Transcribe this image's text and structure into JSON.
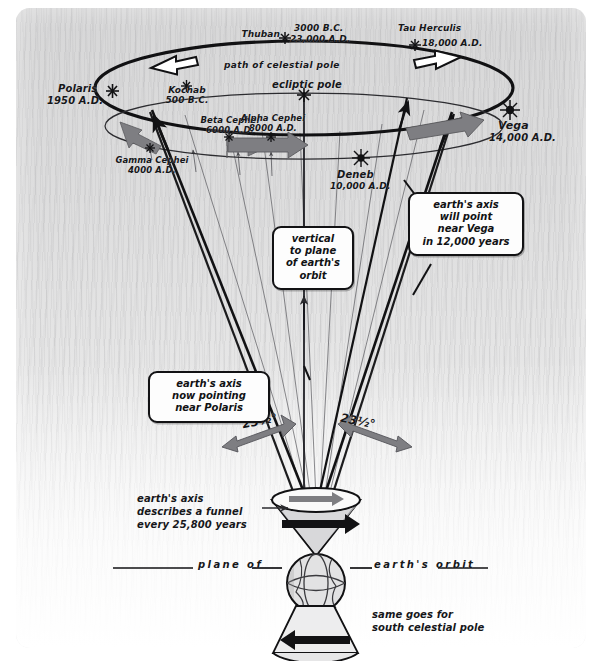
{
  "diagram": {
    "title_region": "precession of the earth's axis",
    "path_label": "path of celestial pole",
    "ecliptic_pole_label": "ecliptic pole",
    "plane_left": "plane of",
    "plane_right": "earth's orbit"
  },
  "stars": [
    {
      "id": "thuban",
      "name": "Thuban",
      "date": "3000 B.C.\n23,000 A.D."
    },
    {
      "id": "tau-herculis",
      "name": "Tau Herculis",
      "date": "18,000 A.D."
    },
    {
      "id": "kochab",
      "name": "Kochab",
      "date": "500 B.C."
    },
    {
      "id": "polaris",
      "name": "Polaris",
      "date": "1950 A.D."
    },
    {
      "id": "vega",
      "name": "Vega",
      "date": "14,000 A.D."
    },
    {
      "id": "gamma-cephei",
      "name": "Gamma Cephei",
      "date": "4000 A.D."
    },
    {
      "id": "beta-cephei",
      "name": "Beta Cephei",
      "date": "6000 A.D."
    },
    {
      "id": "alpha-cephei",
      "name": "Alpha Cephei",
      "date": "8000 A.D."
    },
    {
      "id": "deneb",
      "name": "Deneb",
      "date": "10,000 A.D."
    }
  ],
  "labels": {
    "thuban_name": "Thuban",
    "thuban_date1": "3000 B.C.",
    "thuban_date2": "23,000 A.D.",
    "tau_herculis_name": "Tau Herculis",
    "tau_herculis_date": "18,000 A.D.",
    "kochab_name": "Kochab",
    "kochab_date": "500 B.C.",
    "polaris_name": "Polaris",
    "polaris_date": "1950 A.D.",
    "vega_name": "Vega",
    "vega_date": "14,000 A.D.",
    "gamma_cephei_name": "Gamma Cephei",
    "gamma_cephei_date": "4000 A.D.",
    "beta_cephei_name": "Beta Cephei",
    "beta_cephei_date": "6000 A.D.",
    "alpha_cephei_name": "Alpha Cephei",
    "alpha_cephei_date": "8000 A.D.",
    "deneb_name": "Deneb",
    "deneb_date": "10,000 A.D."
  },
  "callouts": {
    "vega_note": "earth's axis\nwill point\nnear Vega\nin 12,000 years",
    "vertical_note": "vertical\nto plane\nof earth's\norbit",
    "polaris_note": "earth's axis\nnow pointing\nnear Polaris",
    "funnel_note": "earth's axis\ndescribes a funnel\nevery 25,800 years",
    "south_pole_note": "same goes for\nsouth celestial pole"
  },
  "angles": {
    "left": "23½°",
    "right": "23½°"
  },
  "colors": {
    "ink": "#121214",
    "gray_arrow": "#7c7c80",
    "paper": "#d9d9da",
    "callout_bg": "#fdfdfd"
  }
}
